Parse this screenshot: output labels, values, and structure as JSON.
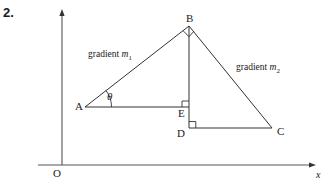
{
  "figure": {
    "question_number": "2.",
    "axes": {
      "x_axis_label": "x",
      "origin_label": "O"
    },
    "vertices": [
      {
        "id": "A",
        "label": "A",
        "x": 85,
        "y": 107
      },
      {
        "id": "B",
        "label": "B",
        "x": 189,
        "y": 26
      },
      {
        "id": "C",
        "label": "C",
        "x": 272,
        "y": 128
      },
      {
        "id": "D",
        "label": "D",
        "x": 189,
        "y": 128
      },
      {
        "id": "E",
        "label": "E",
        "x": 189,
        "y": 107
      }
    ],
    "angle_label": "θ",
    "gradient_labels": {
      "left": {
        "text": "gradient",
        "variable": "m",
        "subscript": "1"
      },
      "right": {
        "text": "gradient",
        "variable": "m",
        "subscript": "2"
      }
    },
    "right_angle_marks": [
      "B",
      "E",
      "D"
    ],
    "colors": {
      "stroke": "#333333",
      "axis": "#555555",
      "text": "#1a1a1a",
      "background": "#ffffff"
    }
  }
}
